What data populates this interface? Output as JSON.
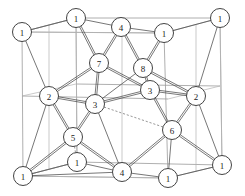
{
  "figure": {
    "name": "crystal-lattice-unit-cell",
    "width": 245,
    "height": 196,
    "background_color": "#ffffff",
    "atom": {
      "fill_color": "#ffffff",
      "stroke_color": "#2e2e2e",
      "radius": 9.5
    },
    "cell_edge_color": "#9a9a9a",
    "bond_color": "#4a4a4a"
  },
  "atoms": [
    {
      "id": "a1",
      "label": "1",
      "x": 22,
      "y": 32,
      "layer": "top",
      "role": "corner"
    },
    {
      "id": "a2",
      "label": "1",
      "x": 76,
      "y": 18,
      "layer": "top",
      "role": "corner"
    },
    {
      "id": "a3",
      "label": "4",
      "x": 121,
      "y": 27,
      "layer": "top",
      "role": "face"
    },
    {
      "id": "a4",
      "label": "1",
      "x": 164,
      "y": 33,
      "layer": "top",
      "role": "corner"
    },
    {
      "id": "a5",
      "label": "1",
      "x": 220,
      "y": 18,
      "layer": "top",
      "role": "corner"
    },
    {
      "id": "a6",
      "label": "7",
      "x": 99,
      "y": 63,
      "layer": "upper-mid",
      "role": "interior"
    },
    {
      "id": "a7",
      "label": "8",
      "x": 143,
      "y": 68,
      "layer": "upper-mid",
      "role": "interior"
    },
    {
      "id": "a8",
      "label": "2",
      "x": 49,
      "y": 96,
      "layer": "mid",
      "role": "face"
    },
    {
      "id": "a9",
      "label": "3",
      "x": 95,
      "y": 104,
      "layer": "mid",
      "role": "interior"
    },
    {
      "id": "a10",
      "label": "3",
      "x": 150,
      "y": 90,
      "layer": "mid",
      "role": "interior"
    },
    {
      "id": "a11",
      "label": "2",
      "x": 196,
      "y": 96,
      "layer": "mid",
      "role": "face"
    },
    {
      "id": "a12",
      "label": "5",
      "x": 73,
      "y": 137,
      "layer": "lower-mid",
      "role": "interior"
    },
    {
      "id": "a13",
      "label": "6",
      "x": 172,
      "y": 130,
      "layer": "lower-mid",
      "role": "interior"
    },
    {
      "id": "a14",
      "label": "1",
      "x": 23,
      "y": 176,
      "layer": "bottom",
      "role": "corner"
    },
    {
      "id": "a15",
      "label": "1",
      "x": 77,
      "y": 162,
      "layer": "bottom",
      "role": "corner"
    },
    {
      "id": "a16",
      "label": "4",
      "x": 122,
      "y": 172,
      "layer": "bottom",
      "role": "face"
    },
    {
      "id": "a17",
      "label": "1",
      "x": 168,
      "y": 178,
      "layer": "bottom",
      "role": "corner"
    },
    {
      "id": "a18",
      "label": "1",
      "x": 222,
      "y": 165,
      "layer": "bottom",
      "role": "corner"
    }
  ],
  "cell_frame": [
    {
      "name": "front-face",
      "points": "23,176 168,178 164,33 22,32 23,176"
    },
    {
      "name": "back-face",
      "points": "77,162 222,165 220,18 76,18 77,162"
    },
    {
      "name": "connect-bl",
      "points": "23,176 77,162"
    },
    {
      "name": "connect-br",
      "points": "168,178 222,165"
    },
    {
      "name": "connect-tl",
      "points": "22,32 76,18"
    },
    {
      "name": "connect-tr",
      "points": "164,33 220,18"
    },
    {
      "name": "mid-horiz-front",
      "points": "22,96 168,99"
    },
    {
      "name": "mid-horiz-back",
      "points": "76,84 220,86"
    },
    {
      "name": "mid-vert-left",
      "points": "49,25 49,170"
    },
    {
      "name": "mid-vert-right",
      "points": "196,25 196,172"
    },
    {
      "name": "mid-vert-c1",
      "points": "122,22 122,177"
    },
    {
      "name": "mid-horiz-top",
      "points": "22,32 164,33"
    },
    {
      "name": "mid-horiz-bot",
      "points": "23,176 168,178"
    },
    {
      "name": "diag-left-upper",
      "points": "22,32 76,18"
    },
    {
      "name": "diag-left-lower",
      "points": "23,176 77,162"
    },
    {
      "name": "mid-conn-l",
      "points": "22,96 76,84"
    },
    {
      "name": "mid-conn-r",
      "points": "168,99 220,86"
    },
    {
      "name": "inner-vert-a",
      "points": "76,18 77,162"
    },
    {
      "name": "inner-vert-b",
      "points": "220,18 222,165"
    }
  ],
  "bonds": [
    {
      "from": "a2",
      "to": "a6",
      "style": "double"
    },
    {
      "from": "a3",
      "to": "a6",
      "style": "double"
    },
    {
      "from": "a3",
      "to": "a7",
      "style": "double"
    },
    {
      "from": "a4",
      "to": "a7",
      "style": "double"
    },
    {
      "from": "a6",
      "to": "a8",
      "style": "double"
    },
    {
      "from": "a6",
      "to": "a9",
      "style": "double"
    },
    {
      "from": "a6",
      "to": "a10",
      "style": "double"
    },
    {
      "from": "a7",
      "to": "a10",
      "style": "double"
    },
    {
      "from": "a7",
      "to": "a9",
      "style": "single"
    },
    {
      "from": "a7",
      "to": "a11",
      "style": "double"
    },
    {
      "from": "a8",
      "to": "a9",
      "style": "double"
    },
    {
      "from": "a9",
      "to": "a10",
      "style": "double"
    },
    {
      "from": "a10",
      "to": "a11",
      "style": "double"
    },
    {
      "from": "a8",
      "to": "a12",
      "style": "double"
    },
    {
      "from": "a9",
      "to": "a12",
      "style": "double"
    },
    {
      "from": "a9",
      "to": "a13",
      "style": "dashed"
    },
    {
      "from": "a10",
      "to": "a13",
      "style": "double"
    },
    {
      "from": "a11",
      "to": "a13",
      "style": "double"
    },
    {
      "from": "a12",
      "to": "a14",
      "style": "double"
    },
    {
      "from": "a12",
      "to": "a16",
      "style": "double"
    },
    {
      "from": "a12",
      "to": "a15",
      "style": "dashed"
    },
    {
      "from": "a13",
      "to": "a16",
      "style": "double"
    },
    {
      "from": "a13",
      "to": "a18",
      "style": "double"
    },
    {
      "from": "a13",
      "to": "a17",
      "style": "single"
    },
    {
      "from": "a9",
      "to": "a16",
      "style": "single"
    },
    {
      "from": "a8",
      "to": "a14",
      "style": "single"
    },
    {
      "from": "a11",
      "to": "a18",
      "style": "single"
    },
    {
      "from": "a14",
      "to": "a16",
      "style": "single"
    },
    {
      "from": "a16",
      "to": "a17",
      "style": "single"
    },
    {
      "from": "a17",
      "to": "a18",
      "style": "single"
    },
    {
      "from": "a14",
      "to": "a15",
      "style": "single"
    },
    {
      "from": "a15",
      "to": "a16",
      "style": "single"
    },
    {
      "from": "a1",
      "to": "a2",
      "style": "single"
    },
    {
      "from": "a2",
      "to": "a3",
      "style": "single"
    },
    {
      "from": "a3",
      "to": "a4",
      "style": "single"
    },
    {
      "from": "a4",
      "to": "a5",
      "style": "single"
    },
    {
      "from": "a8",
      "to": "a1",
      "style": "single"
    },
    {
      "from": "a11",
      "to": "a5",
      "style": "single"
    }
  ]
}
